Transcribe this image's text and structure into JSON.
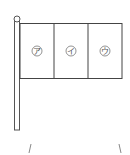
{
  "figure": {
    "type": "flag-diagram",
    "sections": [
      {
        "label": "ア"
      },
      {
        "label": "イ"
      },
      {
        "label": "ウ"
      }
    ],
    "bottom_marks": [
      "/",
      "\\"
    ]
  }
}
